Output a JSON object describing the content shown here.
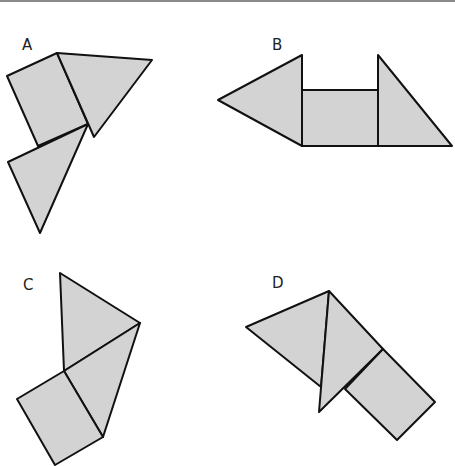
{
  "colors": {
    "fill": "#d3d3d3",
    "stroke": "#111111",
    "background": "#ffffff",
    "top_rule": "#8a8a8a"
  },
  "options": [
    {
      "label": "A",
      "label_pos": [
        22,
        50
      ],
      "pieces": [
        {
          "kind": "square",
          "points": "57,53 7,76 38,146 88,124"
        },
        {
          "kind": "triangle",
          "points": "57,53 152,60 94,137"
        },
        {
          "kind": "triangle",
          "points": "88,124 8,162 40,233"
        }
      ]
    },
    {
      "label": "B",
      "label_pos": [
        272,
        50
      ],
      "pieces": [
        {
          "kind": "triangle",
          "points": "218,100 302,55 302,146"
        },
        {
          "kind": "rectangle",
          "points": "302,90 378,90 378,146 302,146"
        },
        {
          "kind": "triangle",
          "points": "378,55 452,146 378,146"
        }
      ]
    },
    {
      "label": "C",
      "label_pos": [
        23,
        290
      ],
      "pieces": [
        {
          "kind": "triangle",
          "points": "60,273 140,323 64,371"
        },
        {
          "kind": "triangle",
          "points": "64,371 140,323 103,437"
        },
        {
          "kind": "square",
          "points": "64,371 103,437 55,465 17,399"
        }
      ]
    },
    {
      "label": "D",
      "label_pos": [
        272,
        288
      ],
      "pieces": [
        {
          "kind": "triangle",
          "points": "246,327 329,291 321,387"
        },
        {
          "kind": "triangle",
          "points": "329,291 383,349 319,412"
        },
        {
          "kind": "rectangle",
          "points": "383,349 435,402 397,440 345,389"
        }
      ]
    }
  ]
}
